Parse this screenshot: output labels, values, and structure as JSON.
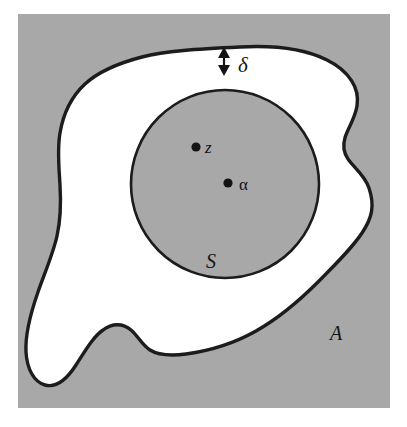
{
  "figure": {
    "kind": "math-set-diagram",
    "panel_bg_color": "#a8a8a8",
    "region_fill_color": "#ffffff",
    "stroke_color": "#1c1c1c",
    "labels": {
      "outer_region": "A",
      "inner_disc": "S",
      "gap_measure": "δ",
      "point_z": "z",
      "point_alpha": "α"
    },
    "points": [
      {
        "name": "z",
        "label": "z",
        "x": 196,
        "y": 147
      },
      {
        "name": "alpha",
        "label": "α",
        "x": 228,
        "y": 183
      }
    ],
    "inner_circle": {
      "cx": 225,
      "cy": 184,
      "r": 94
    },
    "gap_arrow": {
      "x": 224,
      "y_top": 50,
      "y_bottom": 73
    }
  }
}
